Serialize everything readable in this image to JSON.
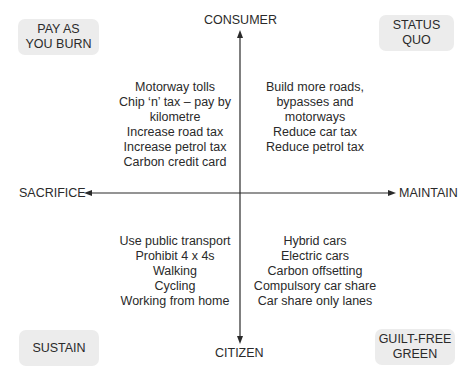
{
  "corners": {
    "top_left": [
      "PAY AS",
      "YOU BURN"
    ],
    "top_right": [
      "STATUS",
      "QUO"
    ],
    "bottom_left": [
      "SUSTAIN"
    ],
    "bottom_right": [
      "GUILT-FREE",
      "GREEN"
    ]
  },
  "axes": {
    "top": "CONSUMER",
    "bottom": "CITIZEN",
    "left": "SACRIFICE",
    "right": "MAINTAIN"
  },
  "quadrants": {
    "top_left": [
      "Motorway tolls",
      "Chip ‘n’ tax – pay by",
      "kilometre",
      "Increase road tax",
      "Increase petrol tax",
      "Carbon credit card"
    ],
    "top_right": [
      "Build more roads,",
      "bypasses and",
      "motorways",
      "Reduce car tax",
      "Reduce petrol tax"
    ],
    "bottom_left": [
      "Use public transport",
      "Prohibit 4 x 4s",
      "Walking",
      "Cycling",
      "Working from home"
    ],
    "bottom_right": [
      "Hybrid cars",
      "Electric cars",
      "Carbon offsetting",
      "Compulsory car share",
      "Car share only lanes"
    ]
  },
  "colors": {
    "box_fill": "#ececec",
    "line": "#2a2a2a"
  }
}
